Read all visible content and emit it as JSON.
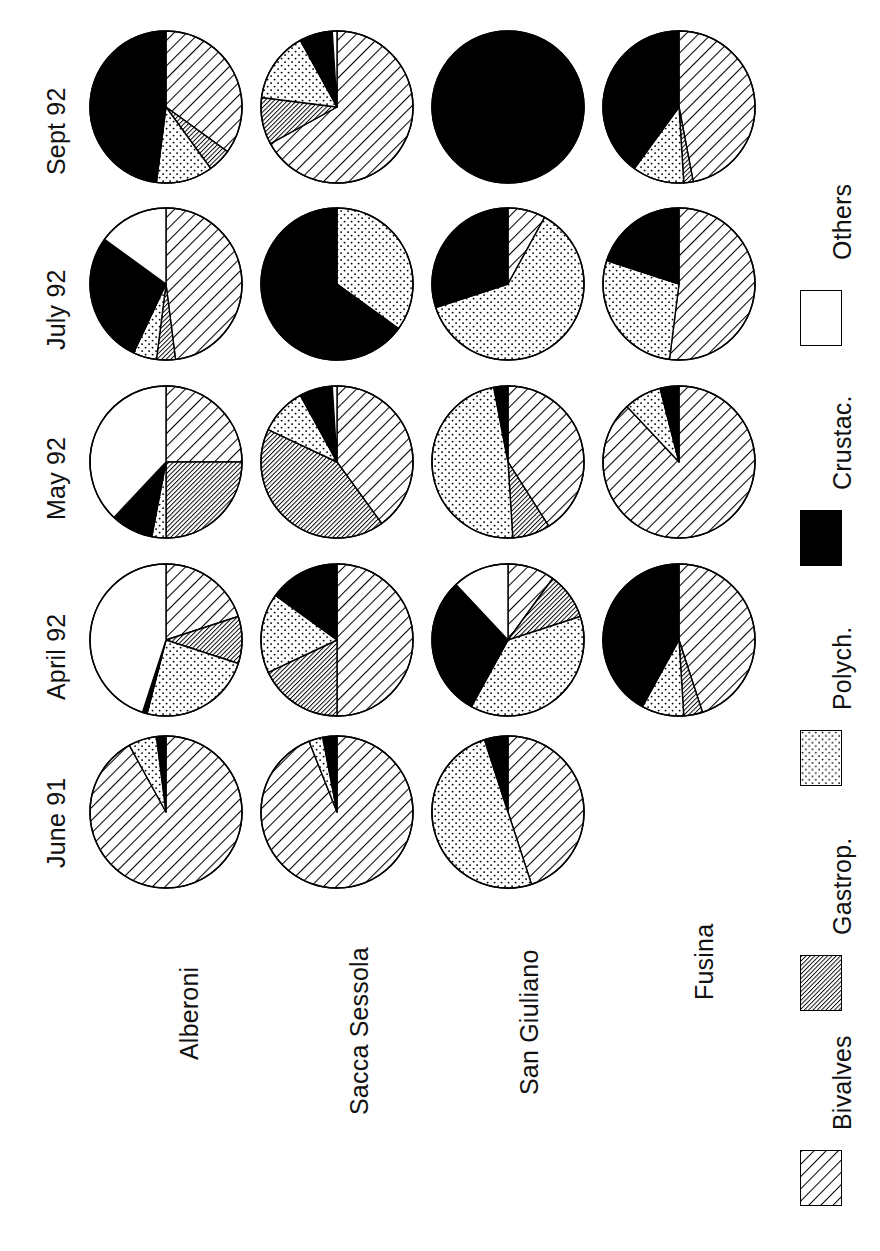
{
  "figure": {
    "orientation": "rotated-90-ccw",
    "dates": [
      "June 91",
      "April 92",
      "May 92",
      "July 92",
      "Sept 92"
    ],
    "sites": [
      "Alberoni",
      "Sacca Sessola",
      "San Giuliano",
      "Fusina"
    ]
  },
  "legend": {
    "title": "",
    "entries": [
      {
        "label": "Bivalves",
        "pattern": "diagonal-hatch",
        "color": "#ffffff"
      },
      {
        "label": "Gastrop.",
        "pattern": "dense-gray-hatch",
        "color": "#7a7a7a"
      },
      {
        "label": "Polych.",
        "pattern": "dotted-stipple",
        "color": "#f2f2f2"
      },
      {
        "label": "Crustac.",
        "pattern": "solid-black",
        "color": "#000000"
      },
      {
        "label": "Others",
        "pattern": "blank-white",
        "color": "#ffffff"
      }
    ]
  },
  "chart_data": {
    "type": "pie",
    "title": "",
    "xlabel": "",
    "ylabel": "",
    "categories": [
      "Bivalves",
      "Gastrop.",
      "Polych.",
      "Crustac.",
      "Others"
    ],
    "units": "percent",
    "columns": [
      "June 91",
      "April 92",
      "May 92",
      "July 92",
      "Sept 92"
    ],
    "rows": [
      "Alberoni",
      "Sacca Sessola",
      "San Giuliano",
      "Fusina"
    ],
    "panels": [
      {
        "site": "Alberoni",
        "date": "June 91",
        "values": {
          "Bivalves": 92,
          "Gastrop.": 0,
          "Polych.": 6,
          "Crustac.": 2,
          "Others": 0
        }
      },
      {
        "site": "Alberoni",
        "date": "April 92",
        "values": {
          "Bivalves": 20,
          "Gastrop.": 10,
          "Polych.": 24,
          "Crustac.": 1,
          "Others": 45
        }
      },
      {
        "site": "Alberoni",
        "date": "May 92",
        "values": {
          "Bivalves": 25,
          "Gastrop.": 25,
          "Polych.": 3,
          "Crustac.": 9,
          "Others": 38
        }
      },
      {
        "site": "Alberoni",
        "date": "July 92",
        "values": {
          "Bivalves": 48,
          "Gastrop.": 4,
          "Polych.": 5,
          "Crustac.": 28,
          "Others": 15
        }
      },
      {
        "site": "Alberoni",
        "date": "Sept 92",
        "values": {
          "Bivalves": 35,
          "Gastrop.": 5,
          "Polych.": 12,
          "Crustac.": 48,
          "Others": 0
        }
      },
      {
        "site": "Sacca Sessola",
        "date": "June 91",
        "values": {
          "Bivalves": 94,
          "Gastrop.": 0,
          "Polych.": 3,
          "Crustac.": 3,
          "Others": 0
        }
      },
      {
        "site": "Sacca Sessola",
        "date": "April 92",
        "values": {
          "Bivalves": 50,
          "Gastrop.": 18,
          "Polych.": 17,
          "Crustac.": 15,
          "Others": 0
        }
      },
      {
        "site": "Sacca Sessola",
        "date": "May 92",
        "values": {
          "Bivalves": 40,
          "Gastrop.": 42,
          "Polych.": 10,
          "Crustac.": 7,
          "Others": 1
        }
      },
      {
        "site": "Sacca Sessola",
        "date": "July 92",
        "values": {
          "Bivalves": 0,
          "Gastrop.": 0,
          "Polych.": 35,
          "Crustac.": 65,
          "Others": 0
        }
      },
      {
        "site": "Sacca Sessola",
        "date": "Sept 92",
        "values": {
          "Bivalves": 67,
          "Gastrop.": 10,
          "Polych.": 15,
          "Crustac.": 7,
          "Others": 1
        }
      },
      {
        "site": "San Giuliano",
        "date": "June 91",
        "values": {
          "Bivalves": 45,
          "Gastrop.": 0,
          "Polych.": 50,
          "Crustac.": 5,
          "Others": 0
        }
      },
      {
        "site": "San Giuliano",
        "date": "April 92",
        "values": {
          "Bivalves": 10,
          "Gastrop.": 10,
          "Polych.": 38,
          "Crustac.": 30,
          "Others": 12
        }
      },
      {
        "site": "San Giuliano",
        "date": "May 92",
        "values": {
          "Bivalves": 41,
          "Gastrop.": 8,
          "Polych.": 48,
          "Crustac.": 3,
          "Others": 0
        }
      },
      {
        "site": "San Giuliano",
        "date": "July 92",
        "values": {
          "Bivalves": 8,
          "Gastrop.": 0,
          "Polych.": 62,
          "Crustac.": 30,
          "Others": 0
        }
      },
      {
        "site": "San Giuliano",
        "date": "Sept 92",
        "values": {
          "Bivalves": 0,
          "Gastrop.": 0,
          "Polych.": 0,
          "Crustac.": 100,
          "Others": 0
        }
      },
      {
        "site": "Fusina",
        "date": "June 91",
        "values": null
      },
      {
        "site": "Fusina",
        "date": "April 92",
        "values": {
          "Bivalves": 45,
          "Gastrop.": 4,
          "Polych.": 9,
          "Crustac.": 42,
          "Others": 0
        }
      },
      {
        "site": "Fusina",
        "date": "May 92",
        "values": {
          "Bivalves": 88,
          "Gastrop.": 0,
          "Polych.": 8,
          "Crustac.": 4,
          "Others": 0
        }
      },
      {
        "site": "Fusina",
        "date": "July 92",
        "values": {
          "Bivalves": 52,
          "Gastrop.": 0,
          "Polych.": 28,
          "Crustac.": 20,
          "Others": 0
        }
      },
      {
        "site": "Fusina",
        "date": "Sept 92",
        "values": {
          "Bivalves": 47,
          "Gastrop.": 2,
          "Polych.": 11,
          "Crustac.": 40,
          "Others": 0
        }
      }
    ]
  }
}
